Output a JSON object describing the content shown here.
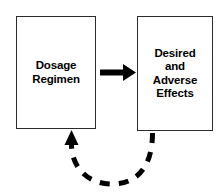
{
  "diagram": {
    "background_color": "#ffffff",
    "stroke_color": "#000000",
    "box_border_color": "#2b2b2b",
    "nodes": [
      {
        "id": "dosage-regimen",
        "label": "Dosage\nRegimen",
        "lines": [
          "Dosage",
          "Regimen"
        ]
      },
      {
        "id": "desired-adverse-effects",
        "label": "Desired\nand\nAdverse\nEffects",
        "lines": [
          "Desired",
          "and",
          "Adverse",
          "Effects"
        ]
      }
    ],
    "connectors": [
      {
        "id": "forward-arrow",
        "style": "solid",
        "direction": "left-to-right",
        "from": "dosage-regimen",
        "to": "desired-adverse-effects",
        "label": ""
      },
      {
        "id": "feedback-arrow",
        "style": "dashed",
        "direction": "right-to-left",
        "from": "desired-adverse-effects",
        "to": "dosage-regimen",
        "label": ""
      }
    ]
  }
}
